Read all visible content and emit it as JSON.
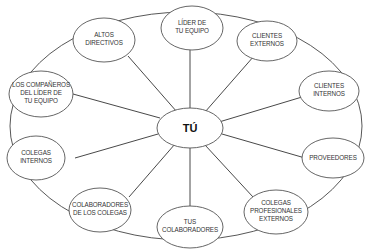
{
  "diagram": {
    "type": "hub-and-spoke",
    "center": {
      "label": "TÚ"
    },
    "nodes": [
      {
        "id": "lider",
        "lines": [
          "LÍDER DE",
          "TU EQUIPO"
        ]
      },
      {
        "id": "clientes-externos",
        "lines": [
          "CLIENTES",
          "EXTERNOS"
        ]
      },
      {
        "id": "clientes-internos",
        "lines": [
          "CLIENTES",
          "INTERNOS"
        ]
      },
      {
        "id": "proveedores",
        "lines": [
          "PROVEEDORES"
        ]
      },
      {
        "id": "colegas-profesionales",
        "lines": [
          "COLEGAS",
          "PROFESIONALES",
          "EXTERNOS"
        ]
      },
      {
        "id": "tus-colaboradores",
        "lines": [
          "TUS",
          "COLABORADORES"
        ]
      },
      {
        "id": "colaboradores-colegas",
        "lines": [
          "COLABORADORES",
          "DE LOS COLEGAS"
        ]
      },
      {
        "id": "colegas-internos",
        "lines": [
          "COLEGAS",
          "INTERNOS"
        ]
      },
      {
        "id": "companeros-lider",
        "lines": [
          "LOS COMPAÑEROS",
          "DEL LÍDER DE",
          "TU EQUIPO"
        ]
      },
      {
        "id": "altos-directivos",
        "lines": [
          "ALTOS",
          "DIRECTIVOS"
        ]
      }
    ]
  }
}
